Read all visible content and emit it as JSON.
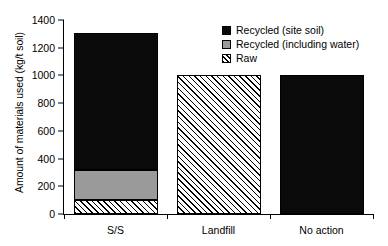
{
  "chart_data": {
    "type": "bar",
    "title": "",
    "subtitle": "",
    "xlabel": "",
    "ylabel": "Amount of materials used (kg/t soil)",
    "categories": [
      "S/S",
      "Landfill",
      "No action"
    ],
    "series": [
      {
        "name": "Raw",
        "fill": "hatch",
        "values": [
          100,
          1000,
          0
        ]
      },
      {
        "name": "Recycled (including water)",
        "fill": "gray",
        "values": [
          220,
          0,
          0
        ]
      },
      {
        "name": "Recycled (site soil)",
        "fill": "black",
        "values": [
          990,
          0,
          1000
        ]
      }
    ],
    "stacked": true,
    "totals": [
      1310,
      1000,
      1000
    ],
    "ylim": [
      0,
      1400
    ],
    "yticks": [
      0,
      200,
      400,
      600,
      800,
      1000,
      1200,
      1400
    ],
    "ytick_labels": [
      "0",
      "200",
      "400",
      "600",
      "800",
      "1000",
      "1200",
      "1400"
    ],
    "grid": false,
    "legend_position": "top-right",
    "legend": [
      {
        "label": "Recycled (site soil)",
        "swatch": "black"
      },
      {
        "label": "Recycled (including water)",
        "swatch": "gray"
      },
      {
        "label": "Raw",
        "swatch": "hatch"
      }
    ],
    "colors": {
      "recycled_site_soil": "#0a0a0a",
      "recycled_including_water": "#9a9a9a",
      "raw_background": "#ffffff",
      "raw_hatch": "#000000",
      "axis": "#000000",
      "background": "#ffffff"
    }
  }
}
